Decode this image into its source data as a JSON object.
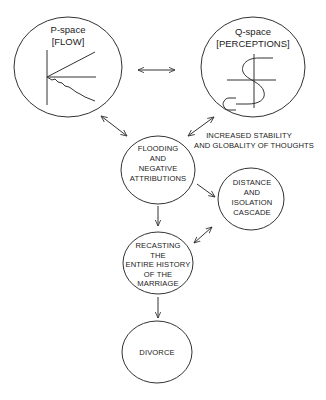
{
  "diagram": {
    "nodes": {
      "p_space": {
        "line1": "P-space",
        "line2": "[FLOW]"
      },
      "q_space": {
        "line1": "Q-space",
        "line2": "[PERCEPTIONS]"
      },
      "flooding": {
        "lines": [
          "FLOODING",
          "AND",
          "NEGATIVE",
          "ATTRIBUTIONS"
        ]
      },
      "distance": {
        "lines": [
          "DISTANCE",
          "AND",
          "ISOLATION",
          "CASCADE"
        ]
      },
      "recasting": {
        "lines": [
          "RECASTING",
          "THE",
          "ENTIRE HISTORY",
          "OF THE",
          "MARRIAGE"
        ]
      },
      "divorce": {
        "label": "DIVORCE"
      }
    },
    "annotation": {
      "line1": "INCREASED STABILITY",
      "line2": "AND GLOBALITY OF THOUGHTS"
    },
    "edges": [
      {
        "from": "p_space",
        "to": "q_space",
        "type": "bidirectional"
      },
      {
        "from": "p_space",
        "to": "flooding",
        "type": "bidirectional"
      },
      {
        "from": "q_space",
        "to": "flooding",
        "type": "bidirectional"
      },
      {
        "from": "flooding",
        "to": "distance",
        "type": "directed"
      },
      {
        "from": "flooding",
        "to": "recasting",
        "type": "directed"
      },
      {
        "from": "recasting",
        "to": "distance",
        "type": "bidirectional"
      },
      {
        "from": "recasting",
        "to": "divorce",
        "type": "directed"
      }
    ],
    "colors": {
      "stroke": "#333333",
      "text": "#222222",
      "background": "#ffffff"
    }
  }
}
